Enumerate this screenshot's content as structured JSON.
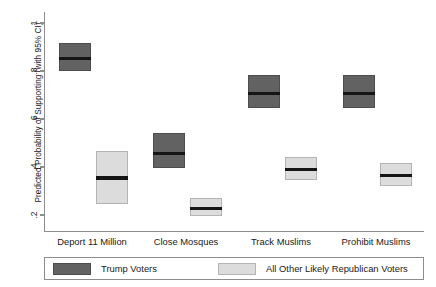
{
  "chart_data": {
    "type": "bar",
    "title": "",
    "subtitle": "",
    "xlabel": "",
    "ylabel": "Predicted Probability of Supporting (with 95% CI)",
    "ylim": [
      0.16,
      1.03
    ],
    "yticks": [
      0.2,
      0.4,
      0.6,
      0.8,
      1
    ],
    "ytick_labels": [
      ".2",
      ".4",
      ".6",
      ".8",
      "1"
    ],
    "grid": false,
    "legend_position": "bottom",
    "categories": [
      "Deport 11 Million",
      "Close Mosques",
      "Track Muslims",
      "Prohibit Muslims"
    ],
    "series": [
      {
        "name": "Trump Voters",
        "color": "#626262",
        "values": [
          0.855,
          0.462,
          0.712,
          0.712
        ],
        "ci_low": [
          0.8,
          0.395,
          0.645,
          0.645
        ],
        "ci_high": [
          0.918,
          0.54,
          0.782,
          0.782
        ]
      },
      {
        "name": "All Other Likely Republican Voters",
        "color": "#dcdcdc",
        "values": [
          0.358,
          0.232,
          0.395,
          0.368
        ],
        "ci_low": [
          0.245,
          0.197,
          0.347,
          0.32
        ],
        "ci_high": [
          0.468,
          0.272,
          0.443,
          0.418
        ]
      }
    ]
  },
  "axis": {
    "y_title": "Predicted Probability of Supporting (with 95% CI)",
    "ticks": [
      {
        "label": "1",
        "value": 1
      },
      {
        "label": ".8",
        "value": 0.8
      },
      {
        "label": ".6",
        "value": 0.6
      },
      {
        "label": ".4",
        "value": 0.4
      },
      {
        "label": ".2",
        "value": 0.2
      }
    ]
  },
  "xcategories": [
    {
      "label": "Deport 11 Million"
    },
    {
      "label": "Close Mosques"
    },
    {
      "label": "Track Muslims"
    },
    {
      "label": "Prohibit Muslims"
    }
  ],
  "legend": {
    "entries": [
      {
        "label": "Trump Voters",
        "color": "#626262"
      },
      {
        "label": "All Other Likely Republican Voters",
        "color": "#dcdcdc"
      }
    ]
  }
}
